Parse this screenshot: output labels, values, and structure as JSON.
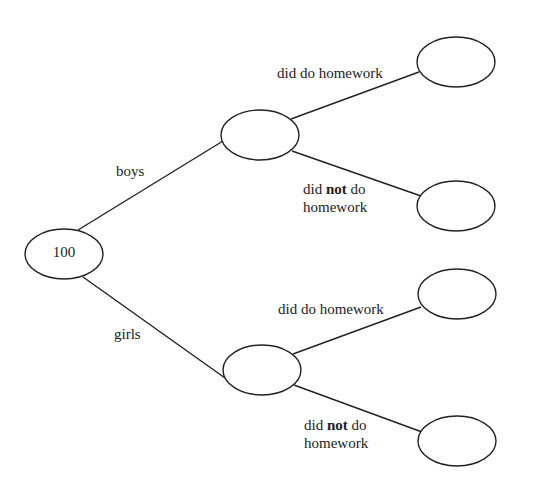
{
  "diagram": {
    "type": "tree-diagram",
    "root": {
      "value": "100"
    },
    "branches": [
      {
        "label": "boys",
        "node_value": "",
        "children": [
          {
            "label_parts": [
              "did do homework"
            ],
            "node_value": ""
          },
          {
            "label_parts": [
              "did ",
              "not",
              " do",
              "homework"
            ],
            "node_value": ""
          }
        ]
      },
      {
        "label": "girls",
        "node_value": "",
        "children": [
          {
            "label_parts": [
              "did do homework"
            ],
            "node_value": ""
          },
          {
            "label_parts": [
              "did ",
              "not",
              " do",
              "homework"
            ],
            "node_value": ""
          }
        ]
      }
    ],
    "colors": {
      "stroke": "#222222",
      "background": "#ffffff"
    }
  }
}
